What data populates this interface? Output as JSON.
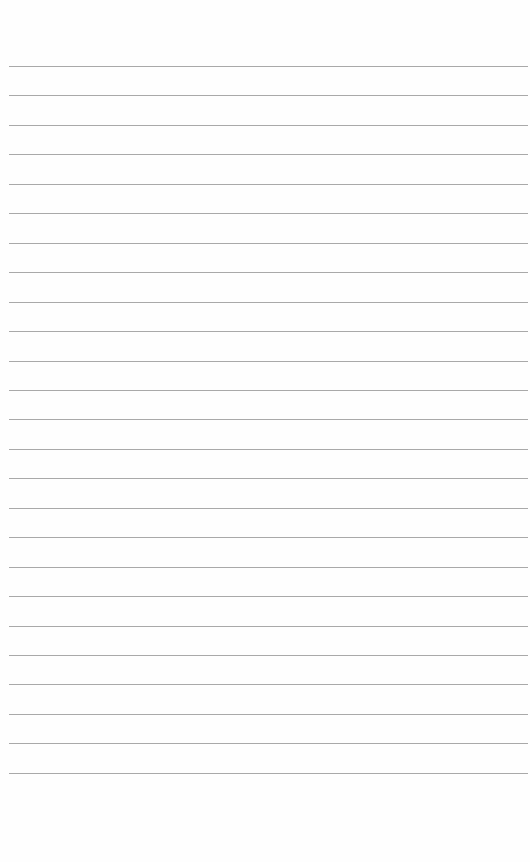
{
  "page": {
    "type": "lined-notebook-page",
    "background_color": "#fefefe",
    "rule_color": "#a9a9a9",
    "rule_count": 25,
    "first_rule_y": 66,
    "rule_spacing": 29.45,
    "rule_left": 9,
    "content": "blank (faint reverse-side handwriting bleed-through only)"
  }
}
